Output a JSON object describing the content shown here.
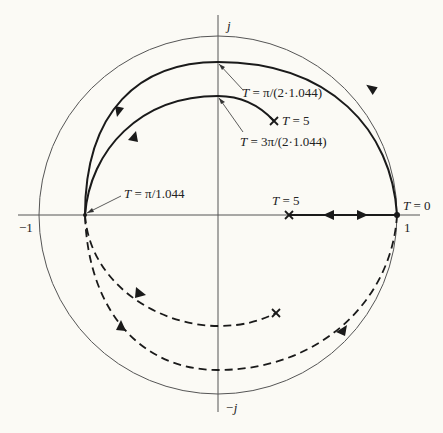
{
  "diagram": {
    "type": "root-locus-unit-circle",
    "colors": {
      "background": "#fbfaf5",
      "ink": "#1a1a1a",
      "thin": "#555555"
    },
    "axes": {
      "real_neg_label": "−1",
      "real_pos_label": "1",
      "imag_pos_label": "j",
      "imag_neg_label": "−j"
    },
    "labels": {
      "t_pi_2": "T = π/(2·1.044)",
      "t_3pi_2": "T = 3π/(2·1.044)",
      "t_5_upper": "T = 5",
      "t_pi": "T = π/1.044",
      "t_5_axis": "T = 5",
      "t_0": "T = 0"
    },
    "curves": [
      {
        "name": "outer-solid-locus",
        "style": "solid",
        "from": "T = 0",
        "via": "T = π/(2·1.044)",
        "to": "T = π/1.044"
      },
      {
        "name": "inner-solid-locus",
        "style": "solid",
        "from": "T = π/1.044",
        "via": "T = 3π/(2·1.044)",
        "to": "T = 5"
      },
      {
        "name": "real-axis-segment",
        "style": "solid",
        "from": "T = 0",
        "to": "T = 5"
      },
      {
        "name": "outer-dashed-locus",
        "style": "dashed",
        "from": "T = 0",
        "to": "T = π/1.044"
      },
      {
        "name": "inner-dashed-locus",
        "style": "dashed",
        "from": "T = π/1.044",
        "to": "end-x"
      }
    ]
  }
}
